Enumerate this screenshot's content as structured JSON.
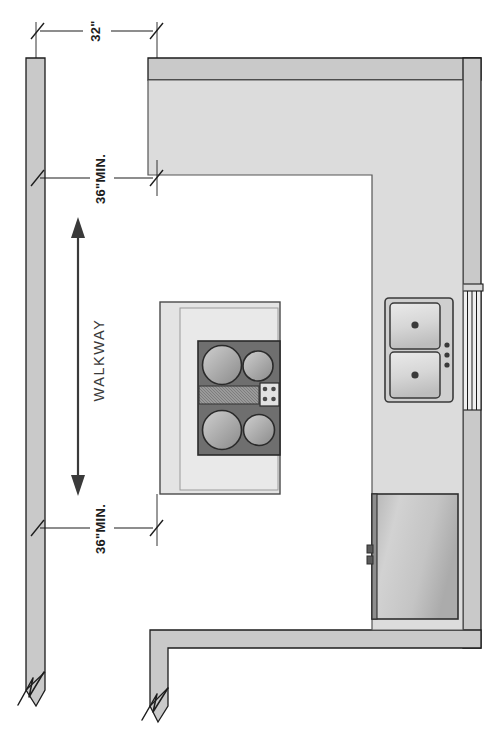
{
  "drawing": {
    "type": "architectural-floor-plan",
    "subject": "Kitchen layout plan with walkway clearances",
    "units": "inches",
    "background_color": "#ffffff",
    "line_color": "#1d1d1d",
    "wall_fill": "#c9c9c9",
    "counter_fill": "#dcdcdc",
    "appliance_fill": "#b8b8b8",
    "cooktop_fill": "#6f6f6f"
  },
  "dimensions": [
    {
      "id": "dim-top",
      "label": "32\"",
      "kind": "linear-horizontal",
      "note": "clearance from left wall to top counter run"
    },
    {
      "id": "dim-upper-min",
      "label": "36\"MIN.",
      "kind": "linear-horizontal",
      "note": "minimum walkway clearance at upper end"
    },
    {
      "id": "dim-lower-min",
      "label": "36\"MIN.",
      "kind": "linear-horizontal",
      "note": "minimum walkway clearance at lower end"
    }
  ],
  "annotations": [
    {
      "id": "walkway-label",
      "label": "WALKWAY",
      "orientation": "vertical",
      "has_double_arrow": true
    }
  ],
  "walls": [
    {
      "id": "wall-left",
      "name": "left-exterior-wall",
      "break_symbol": true
    },
    {
      "id": "wall-top",
      "name": "top-exterior-wall",
      "break_symbol": false
    },
    {
      "id": "wall-right",
      "name": "right-exterior-wall",
      "break_symbol": false
    },
    {
      "id": "wall-bottom",
      "name": "bottom-exterior-wall",
      "break_symbol": true
    }
  ],
  "fixtures": [
    {
      "id": "counter-top-run",
      "name": "upper-counter-run",
      "type": "countertop"
    },
    {
      "id": "counter-right-run",
      "name": "right-counter-run",
      "type": "countertop"
    },
    {
      "id": "island",
      "name": "kitchen-island",
      "type": "island-with-cooktop"
    },
    {
      "id": "cooktop",
      "name": "cooktop",
      "type": "range-top",
      "burners": 4,
      "knobs": 4,
      "has_griddle": true
    },
    {
      "id": "sink",
      "name": "double-bowl-sink",
      "type": "sink",
      "bowls": 2,
      "drains": 2,
      "fixture_holes": 3
    },
    {
      "id": "refrigerator",
      "name": "refrigerator",
      "type": "appliance",
      "handle_side": "left"
    },
    {
      "id": "window",
      "name": "window",
      "type": "window-in-wall",
      "wall": "right-exterior-wall"
    }
  ]
}
